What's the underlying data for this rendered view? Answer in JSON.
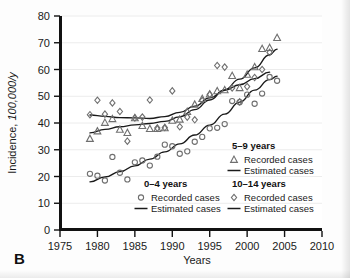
{
  "figure": {
    "panel_label": "B",
    "background_color": "#fdfdfd",
    "axis_color": "#111111"
  },
  "chart_data": {
    "type": "scatter",
    "title": "",
    "subtitle": "",
    "xlabel": "Years",
    "ylabel": "Incidence, 100,000/y",
    "ylabel_plain": "Incidence, ",
    "ylabel_italic": "100,000/y",
    "xlim": [
      1975,
      2010
    ],
    "ylim": [
      0,
      80
    ],
    "xticks": [
      1975,
      1980,
      1985,
      1990,
      1995,
      2000,
      2005,
      2010
    ],
    "xtick_labels": [
      "1975",
      "1980",
      "1985",
      "1990",
      "1995",
      "2000",
      "2005",
      "2010"
    ],
    "yticks": [
      0,
      10,
      20,
      30,
      40,
      50,
      60,
      70,
      80
    ],
    "ytick_labels": [
      "0",
      "10",
      "20",
      "30",
      "40",
      "50",
      "60",
      "70",
      "80"
    ],
    "grid": true,
    "grid_axis": "y",
    "legend_position": "inside-lower-right",
    "marker_color": "#6f6f6f",
    "line_color": "#1a1a1a",
    "series": [
      {
        "name": "0–4 years",
        "marker": "circle",
        "marker_label": "Recorded cases",
        "line_label": "Estimated cases",
        "x": [
          1979,
          1980,
          1981,
          1982,
          1983,
          1984,
          1985,
          1986,
          1987,
          1988,
          1989,
          1990,
          1991,
          1992,
          1993,
          1994,
          1995,
          1996,
          1997,
          1998,
          1999,
          2000,
          2001,
          2002,
          2003,
          2004
        ],
        "values": [
          21.0,
          20.3,
          18.5,
          27.3,
          21.4,
          18.9,
          25.3,
          26.0,
          24.1,
          27.4,
          31.9,
          31.3,
          28.5,
          29.4,
          33.0,
          34.8,
          38.0,
          38.2,
          39.6,
          48.2,
          47.8,
          50.6,
          47.2,
          51.0,
          57.2,
          55.8
        ],
        "fit_x": [
          1979,
          1981,
          1983,
          1985,
          1987,
          1989,
          1991,
          1993,
          1995,
          1997,
          1999,
          2001,
          2003,
          2004
        ],
        "fit_values": [
          18.0,
          19.8,
          21.8,
          24.0,
          26.5,
          29.2,
          32.2,
          35.5,
          39.2,
          43.3,
          47.8,
          52.3,
          56.2,
          57.5
        ]
      },
      {
        "name": "5–9 years",
        "marker": "triangle",
        "marker_label": "Recorded cases",
        "line_label": "Estimated cases",
        "x": [
          1979,
          1980,
          1981,
          1982,
          1983,
          1984,
          1985,
          1986,
          1987,
          1988,
          1989,
          1990,
          1991,
          1992,
          1993,
          1994,
          1995,
          1996,
          1997,
          1998,
          1999,
          2000,
          2001,
          2002,
          2003,
          2004
        ],
        "values": [
          34.2,
          37.0,
          40.2,
          41.6,
          37.6,
          36.4,
          41.9,
          39.0,
          37.9,
          37.9,
          38.2,
          41.0,
          41.4,
          44.3,
          47.0,
          49.1,
          50.8,
          52.0,
          52.4,
          57.7,
          53.2,
          58.2,
          61.0,
          67.8,
          68.2,
          71.9
        ],
        "fit_x": [
          1979,
          1981,
          1983,
          1985,
          1987,
          1989,
          1991,
          1993,
          1995,
          1997,
          1999,
          2001,
          2003,
          2004
        ],
        "fit_values": [
          36.3,
          37.6,
          38.6,
          39.3,
          39.8,
          40.6,
          42.3,
          45.0,
          48.6,
          52.4,
          56.4,
          60.6,
          65.5,
          67.6
        ]
      },
      {
        "name": "10–14 years",
        "marker": "diamond",
        "marker_label": "Recorded cases",
        "line_label": "Estimated cases",
        "x": [
          1979,
          1980,
          1981,
          1982,
          1983,
          1984,
          1985,
          1986,
          1987,
          1988,
          1989,
          1990,
          1991,
          1992,
          1993,
          1994,
          1995,
          1996,
          1997,
          1998,
          1999,
          2000,
          2001,
          2002,
          2003
        ],
        "values": [
          43.1,
          48.5,
          43.3,
          47.5,
          44.3,
          33.2,
          41.9,
          42.2,
          48.6,
          38.1,
          38.3,
          52.0,
          38.6,
          42.2,
          41.2,
          48.4,
          50.7,
          61.5,
          60.9,
          53.1,
          47.9,
          53.6,
          57.0,
          60.0,
          66.4
        ],
        "fit_x": [
          1979,
          1981,
          1983,
          1985,
          1987,
          1989,
          1991,
          1993,
          1995,
          1997,
          1999,
          2001,
          2003
        ],
        "fit_values": [
          43.0,
          42.5,
          42.0,
          41.9,
          41.7,
          42.4,
          44.0,
          46.3,
          49.4,
          52.2,
          54.3,
          56.6,
          59.0
        ]
      }
    ]
  },
  "legend": {
    "blocks": [
      {
        "title": "0–4 years",
        "marker": "circle",
        "recorded_label": "Recorded cases",
        "estimated_label": "Estimated cases"
      },
      {
        "title": "5–9 years",
        "marker": "triangle",
        "recorded_label": "Recorded cases",
        "estimated_label": "Estimated cases"
      },
      {
        "title": "10–14 years",
        "marker": "diamond",
        "recorded_label": "Recorded cases",
        "estimated_label": "Estimated cases"
      }
    ]
  }
}
